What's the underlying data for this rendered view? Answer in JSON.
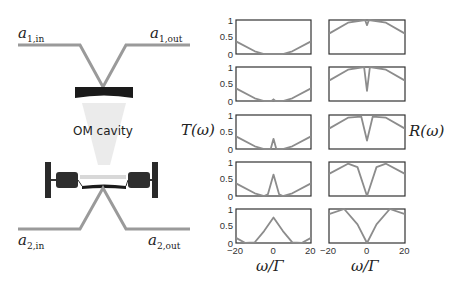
{
  "figure": {
    "ports": {
      "a1_in": {
        "base": "a",
        "sub": "1,in"
      },
      "a1_out": {
        "base": "a",
        "sub": "1,out"
      },
      "a2_in": {
        "base": "a",
        "sub": "2,in"
      },
      "a2_out": {
        "base": "a",
        "sub": "2,out"
      }
    },
    "cavity_label": "OM cavity",
    "colors": {
      "waveguide": "#9a9a9a",
      "mirror": "#1a1a1a",
      "curve": "#8c8c8c",
      "frame": "#333333"
    }
  },
  "chart_data": [
    {
      "type": "line",
      "title": "",
      "ylabel": "T(ω)",
      "xlabel": "ω/Γ",
      "xlim": [
        -20,
        20
      ],
      "ylim": [
        0,
        1
      ],
      "xticks": [
        "-20",
        "0",
        "20"
      ],
      "yticks": [
        "0",
        "0.5",
        "1"
      ],
      "grid": false,
      "panels": [
        {
          "description": "broad V-shaped transmission, zero near center",
          "x": [
            -20,
            -10,
            -5,
            0,
            5,
            10,
            20
          ],
          "y": [
            0.37,
            0.08,
            0,
            0,
            0,
            0.08,
            0.37
          ]
        },
        {
          "description": "tiny peak at center",
          "x": [
            -20,
            -10,
            -5,
            -1,
            0,
            1,
            5,
            10,
            20
          ],
          "y": [
            0.37,
            0.08,
            0,
            0,
            0.05,
            0,
            0,
            0.08,
            0.37
          ]
        },
        {
          "description": "small peak at center",
          "x": [
            -20,
            -10,
            -5,
            -1.5,
            0,
            1.5,
            5,
            10,
            20
          ],
          "y": [
            0.37,
            0.08,
            0,
            0,
            0.3,
            0,
            0,
            0.08,
            0.37
          ]
        },
        {
          "description": "medium peak at center",
          "x": [
            -20,
            -10,
            -5,
            -3,
            0,
            3,
            5,
            10,
            20
          ],
          "y": [
            0.37,
            0.08,
            0,
            0.05,
            0.63,
            0.05,
            0,
            0.08,
            0.37
          ]
        },
        {
          "description": "broad peak at center",
          "x": [
            -20,
            -15,
            -10,
            -5,
            0,
            5,
            10,
            15,
            20
          ],
          "y": [
            0.15,
            0,
            0.02,
            0.35,
            0.75,
            0.35,
            0.02,
            0,
            0.15
          ]
        }
      ]
    },
    {
      "type": "line",
      "title": "",
      "ylabel": "R(ω)",
      "xlabel": "ω/Γ",
      "xlim": [
        -20,
        20
      ],
      "ylim": [
        0,
        1
      ],
      "xticks": [
        "-20",
        "0",
        "20"
      ],
      "yticks": [],
      "grid": false,
      "panels": [
        {
          "description": "inverted V with tiny dip",
          "x": [
            -20,
            -10,
            -1,
            0,
            1,
            10,
            20
          ],
          "y": [
            0.6,
            0.92,
            1.0,
            0.85,
            1.0,
            0.92,
            0.6
          ]
        },
        {
          "description": "inverted V with small dip",
          "x": [
            -20,
            -10,
            -1.5,
            0,
            1.5,
            10,
            20
          ],
          "y": [
            0.6,
            0.92,
            1.0,
            0.3,
            1.0,
            0.92,
            0.6
          ]
        },
        {
          "description": "dip to ~0.25",
          "x": [
            -20,
            -10,
            -3,
            0,
            3,
            10,
            20
          ],
          "y": [
            0.6,
            0.92,
            0.95,
            0.25,
            0.95,
            0.92,
            0.6
          ]
        },
        {
          "description": "dip to zero",
          "x": [
            -20,
            -10,
            -5,
            0,
            5,
            10,
            20
          ],
          "y": [
            0.65,
            0.95,
            0.85,
            0,
            0.85,
            0.95,
            0.65
          ]
        },
        {
          "description": "broad dip to zero",
          "x": [
            -20,
            -12,
            -5,
            0,
            5,
            12,
            20
          ],
          "y": [
            0.85,
            1.0,
            0.55,
            0,
            0.55,
            1.0,
            0.85
          ]
        }
      ]
    }
  ],
  "labels": {
    "T": "T(ω)",
    "R": "R(ω)",
    "xaxis": "ω/Γ",
    "y1": "1",
    "y05": "0.5",
    "y0": "0",
    "xm20": "−20",
    "x0": "0",
    "x20": "20"
  }
}
